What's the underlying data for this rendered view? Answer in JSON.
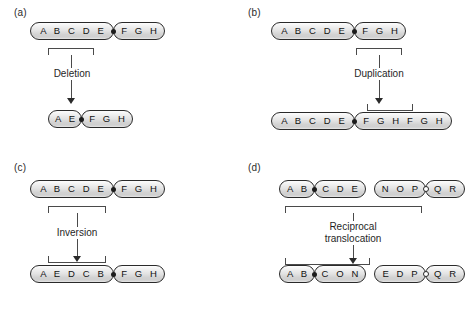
{
  "figure": {
    "background_color": "#ffffff",
    "line_color": "#2a2a2a",
    "centromere_filled_color": "#1b1b1b",
    "centromere_open_color": "#ffffff"
  },
  "panels": [
    {
      "id": "a",
      "label": "(a)",
      "operation": "Deletion",
      "before": {
        "chromosomes": [
          {
            "arms": [
              {
                "letters": "A B C D E"
              },
              {
                "letters": "F G H"
              }
            ],
            "centromere": "filled"
          }
        ]
      },
      "after": {
        "chromosomes": [
          {
            "arms": [
              {
                "letters": "A E"
              },
              {
                "letters": "F G H"
              }
            ],
            "centromere": "filled"
          }
        ]
      },
      "bracket_segment_before": "B C D E",
      "bracket_segment_after": "",
      "note": "Segment B C D removed"
    },
    {
      "id": "b",
      "label": "(b)",
      "operation": "Duplication",
      "before": {
        "chromosomes": [
          {
            "arms": [
              {
                "letters": "A B C D E"
              },
              {
                "letters": "F G H"
              }
            ],
            "centromere": "filled"
          }
        ]
      },
      "after": {
        "chromosomes": [
          {
            "arms": [
              {
                "letters": "A B C D E"
              },
              {
                "letters": "F G H F G H"
              }
            ],
            "centromere": "filled"
          }
        ]
      },
      "bracket_segment_before": "F G H",
      "bracket_segment_after": "F G H",
      "note": "Segment F G H duplicated in tandem"
    },
    {
      "id": "c",
      "label": "(c)",
      "operation": "Inversion",
      "before": {
        "chromosomes": [
          {
            "arms": [
              {
                "letters": "A B C D E"
              },
              {
                "letters": "F G H"
              }
            ],
            "centromere": "filled"
          }
        ]
      },
      "after": {
        "chromosomes": [
          {
            "arms": [
              {
                "letters": "A E D C B"
              },
              {
                "letters": "F G H"
              }
            ],
            "centromere": "filled"
          }
        ]
      },
      "bracket_segment_before": "B C D E",
      "bracket_segment_after": "E D C B",
      "note": "Segment B C D E reversed to E D C B"
    },
    {
      "id": "d",
      "label": "(d)",
      "operation": "Reciprocal translocation",
      "operation_line1": "Reciprocal",
      "operation_line2": "translocation",
      "before": {
        "chromosomes": [
          {
            "arms": [
              {
                "letters": "A B"
              },
              {
                "letters": "C D E"
              }
            ],
            "centromere": "filled"
          },
          {
            "arms": [
              {
                "letters": "N O P"
              },
              {
                "letters": "Q R"
              }
            ],
            "centromere": "open"
          }
        ]
      },
      "after": {
        "chromosomes": [
          {
            "arms": [
              {
                "letters": "A B"
              },
              {
                "letters": "C O N"
              }
            ],
            "centromere": "filled"
          },
          {
            "arms": [
              {
                "letters": "E D P"
              },
              {
                "letters": "Q R"
              }
            ],
            "centromere": "open"
          }
        ]
      },
      "bracket_segment_before": "C D E / N O P",
      "bracket_segment_after": "C O N / E D P",
      "note": "Segments exchanged between two non-homologous chromosomes"
    }
  ]
}
